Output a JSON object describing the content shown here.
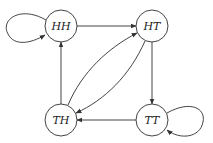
{
  "diagram": {
    "type": "state-transition-graph",
    "nodes": [
      {
        "id": "HH",
        "label": "HH"
      },
      {
        "id": "HT",
        "label": "HT"
      },
      {
        "id": "TH",
        "label": "TH"
      },
      {
        "id": "TT",
        "label": "TT"
      }
    ],
    "edges": [
      {
        "from": "HH",
        "to": "HH"
      },
      {
        "from": "HH",
        "to": "HT"
      },
      {
        "from": "HT",
        "to": "TT"
      },
      {
        "from": "HT",
        "to": "TH"
      },
      {
        "from": "TH",
        "to": "HT"
      },
      {
        "from": "TH",
        "to": "HH"
      },
      {
        "from": "TT",
        "to": "TH"
      },
      {
        "from": "TT",
        "to": "TT"
      }
    ]
  }
}
